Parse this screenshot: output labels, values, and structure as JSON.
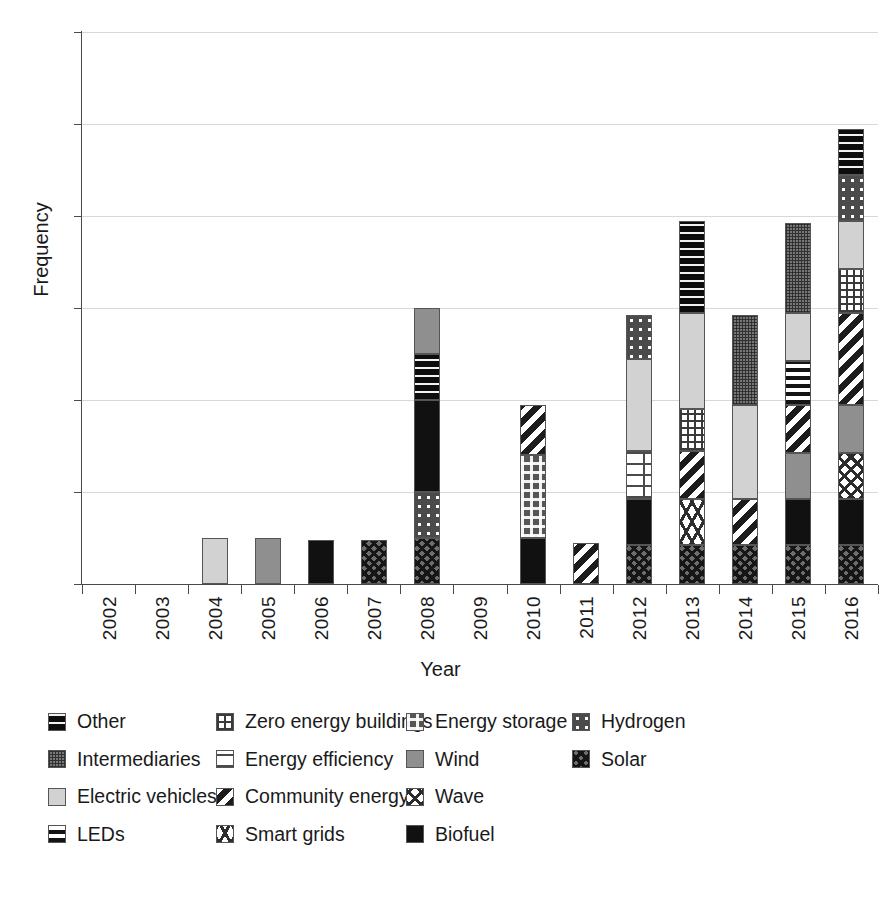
{
  "chart_data": {
    "type": "bar",
    "subtype": "stacked-bar",
    "title": "",
    "xlabel": "Year",
    "ylabel": "Frequency",
    "ylim": [
      0,
      12
    ],
    "ytick_labels": [
      "0",
      "2",
      "4",
      "6",
      "8",
      "10",
      "12"
    ],
    "ytick_values": [
      0,
      2,
      4,
      6,
      8,
      10,
      12
    ],
    "grid": "horizontal",
    "legend_position": "bottom",
    "categories": [
      "2002",
      "2003",
      "2004",
      "2005",
      "2006",
      "2007",
      "2008",
      "2009",
      "2010",
      "2011",
      "2012",
      "2013",
      "2014",
      "2015",
      "2016"
    ],
    "series": [
      {
        "name": "Other",
        "pattern": "p-other",
        "values": [
          0,
          0,
          0,
          0,
          0,
          0,
          1,
          0,
          0,
          0,
          0,
          2,
          0,
          0,
          1
        ]
      },
      {
        "name": "Zero energy buildings",
        "pattern": "p-zeb",
        "values": [
          0,
          0,
          0,
          0,
          0,
          0,
          0,
          0,
          0,
          0,
          0,
          0.9,
          0,
          0,
          0.95
        ]
      },
      {
        "name": "Energy storage",
        "pattern": "p-storage",
        "values": [
          0,
          0,
          0,
          0,
          0,
          0,
          0,
          0,
          1.8,
          0,
          0,
          0,
          0,
          0,
          0
        ]
      },
      {
        "name": "Hydrogen",
        "pattern": "p-hydrogen",
        "values": [
          0,
          0,
          0,
          0,
          0,
          0,
          1,
          0,
          0,
          0,
          0.95,
          0,
          0,
          0,
          1
        ]
      },
      {
        "name": "Intermediaries",
        "pattern": "p-inter",
        "values": [
          0,
          0,
          0,
          0,
          0,
          0,
          0,
          0,
          0,
          0,
          0,
          0,
          1.95,
          1.95,
          0
        ]
      },
      {
        "name": "Energy efficiency",
        "pattern": "p-effic",
        "values": [
          0,
          0,
          0,
          0,
          0,
          0,
          0,
          0,
          0,
          0,
          1.05,
          0,
          0,
          0,
          0
        ]
      },
      {
        "name": "Wind",
        "pattern": "p-wind",
        "values": [
          0,
          0,
          0,
          1,
          0,
          0,
          1,
          0,
          0,
          0,
          0,
          0,
          0,
          1,
          1.05
        ]
      },
      {
        "name": "Solar",
        "pattern": "p-solar",
        "values": [
          0,
          0,
          0,
          0,
          0,
          0.95,
          1,
          0,
          0,
          0,
          0.85,
          0.85,
          0.85,
          0.85,
          0.85
        ]
      },
      {
        "name": "Electric vehicles",
        "pattern": "p-ev",
        "values": [
          0,
          0,
          1,
          0,
          0,
          0,
          0,
          0,
          0,
          0,
          2,
          2.1,
          2.05,
          1.05,
          1.05
        ]
      },
      {
        "name": "Community energy",
        "pattern": "p-community",
        "values": [
          0,
          0,
          0,
          0,
          0,
          0,
          0,
          0,
          1.1,
          0.9,
          0,
          1.05,
          1,
          1.05,
          2
        ]
      },
      {
        "name": "Wave",
        "pattern": "p-wave",
        "values": [
          0,
          0,
          0,
          0,
          0,
          0,
          0,
          0,
          0,
          0,
          0,
          0,
          0,
          0,
          1
        ]
      },
      {
        "name": "LEDs",
        "pattern": "p-leds",
        "values": [
          0,
          0,
          0,
          0,
          0,
          0,
          0,
          0,
          0,
          0,
          0,
          0,
          0,
          0.95,
          0
        ]
      },
      {
        "name": "Smart grids",
        "pattern": "p-smartgrids",
        "values": [
          0,
          0,
          0,
          0,
          0,
          0,
          0,
          0,
          0,
          0,
          0,
          1,
          0,
          0,
          0
        ]
      },
      {
        "name": "Biofuel",
        "pattern": "p-biofuel",
        "values": [
          0,
          0,
          0,
          0,
          0.95,
          0,
          2,
          0,
          1,
          0,
          1,
          0,
          0,
          1,
          1
        ]
      }
    ],
    "stack_order_bottom_to_top": {
      "2004": [
        {
          "series": "Electric vehicles",
          "value": 1
        }
      ],
      "2005": [
        {
          "series": "Wind",
          "value": 1
        }
      ],
      "2006": [
        {
          "series": "Biofuel",
          "value": 0.95
        }
      ],
      "2007": [
        {
          "series": "Solar",
          "value": 0.95
        }
      ],
      "2008": [
        {
          "series": "Solar",
          "value": 1
        },
        {
          "series": "Hydrogen",
          "value": 1
        },
        {
          "series": "Biofuel",
          "value": 2
        },
        {
          "series": "Other",
          "value": 1
        },
        {
          "series": "Wind",
          "value": 1
        }
      ],
      "2010": [
        {
          "series": "Biofuel",
          "value": 1
        },
        {
          "series": "Energy storage",
          "value": 1.8
        },
        {
          "series": "Community energy",
          "value": 1.1
        }
      ],
      "2011": [
        {
          "series": "Community energy",
          "value": 0.9
        }
      ],
      "2012": [
        {
          "series": "Solar",
          "value": 0.85
        },
        {
          "series": "Biofuel",
          "value": 1
        },
        {
          "series": "Energy efficiency",
          "value": 1.05
        },
        {
          "series": "Electric vehicles",
          "value": 2
        },
        {
          "series": "Hydrogen",
          "value": 0.95
        }
      ],
      "2013": [
        {
          "series": "Solar",
          "value": 0.85
        },
        {
          "series": "Smart grids",
          "value": 1
        },
        {
          "series": "Community energy",
          "value": 1.05
        },
        {
          "series": "Zero energy buildings",
          "value": 0.9
        },
        {
          "series": "Electric vehicles",
          "value": 2.1
        },
        {
          "series": "Other",
          "value": 2
        }
      ],
      "2014": [
        {
          "series": "Solar",
          "value": 0.85
        },
        {
          "series": "Community energy",
          "value": 1
        },
        {
          "series": "Electric vehicles",
          "value": 2.05
        },
        {
          "series": "Intermediaries",
          "value": 1.95
        }
      ],
      "2015": [
        {
          "series": "Solar",
          "value": 0.85
        },
        {
          "series": "Biofuel",
          "value": 1
        },
        {
          "series": "Wind",
          "value": 1
        },
        {
          "series": "Community energy",
          "value": 1.05
        },
        {
          "series": "LEDs",
          "value": 0.95
        },
        {
          "series": "Electric vehicles",
          "value": 1.05
        },
        {
          "series": "Intermediaries",
          "value": 1.95
        }
      ],
      "2016": [
        {
          "series": "Solar",
          "value": 0.85
        },
        {
          "series": "Biofuel",
          "value": 1
        },
        {
          "series": "Wave",
          "value": 1
        },
        {
          "series": "Wind",
          "value": 1.05
        },
        {
          "series": "Community energy",
          "value": 2
        },
        {
          "series": "Zero energy buildings",
          "value": 0.95
        },
        {
          "series": "Electric vehicles",
          "value": 1.05
        },
        {
          "series": "Hydrogen",
          "value": 1
        },
        {
          "series": "Other",
          "value": 1
        }
      ]
    },
    "totals": {
      "2002": 0,
      "2003": 0,
      "2004": 1,
      "2005": 1,
      "2006": 0.95,
      "2007": 0.95,
      "2008": 6,
      "2009": 0,
      "2010": 3.9,
      "2011": 0.9,
      "2012": 5.85,
      "2013": 7.9,
      "2014": 5.85,
      "2015": 7.85,
      "2016": 9.85
    }
  },
  "legend": {
    "items": [
      {
        "label": "Other",
        "pattern": "p-other"
      },
      {
        "label": "Zero energy buildings",
        "pattern": "p-zeb"
      },
      {
        "label": "Energy storage",
        "pattern": "p-storage"
      },
      {
        "label": "Hydrogen",
        "pattern": "p-hydrogen"
      },
      {
        "label": "Intermediaries",
        "pattern": "p-inter"
      },
      {
        "label": "Energy efficiency",
        "pattern": "p-effic"
      },
      {
        "label": "Wind",
        "pattern": "p-wind"
      },
      {
        "label": "Solar",
        "pattern": "p-solar"
      },
      {
        "label": "Electric vehicles",
        "pattern": "p-ev"
      },
      {
        "label": "Community energy",
        "pattern": "p-community"
      },
      {
        "label": "Wave",
        "pattern": "p-wave"
      },
      {
        "label": "Solar ",
        "pattern": "p-solar"
      },
      {
        "label": "LEDs",
        "pattern": "p-leds"
      },
      {
        "label": "Smart grids",
        "pattern": "p-smartgrids"
      },
      {
        "label": "Biofuel",
        "pattern": "p-biofuel"
      }
    ]
  },
  "colors": {
    "axis": "#4a4a4a",
    "grid": "#d8d8d8",
    "text": "#1a1a1a",
    "electric_vehicles": "#d2d2d2",
    "wind": "#8f8f8f",
    "biofuel": "#111111"
  }
}
